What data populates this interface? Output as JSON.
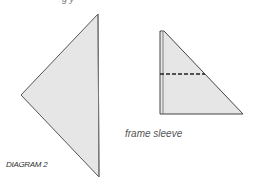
{
  "diagram": {
    "label": "DIAGRAM 2",
    "top_fragment_text": "g     y",
    "left_shape": {
      "name": "large triangle",
      "points": "98,14 21,95 99,177",
      "fill": "#e6e6e6",
      "stroke": "#555555"
    },
    "right_shape": {
      "name": "folded frame sleeve triangle",
      "points": "160,31 163,31 243,114 160,114",
      "fill": "#e6e6e6",
      "stroke": "#444444",
      "fold_line": {
        "x1": 160,
        "y1": 74,
        "x2": 205,
        "y2": 74,
        "style": "dashed"
      }
    },
    "annotation": "frame sleeve"
  }
}
